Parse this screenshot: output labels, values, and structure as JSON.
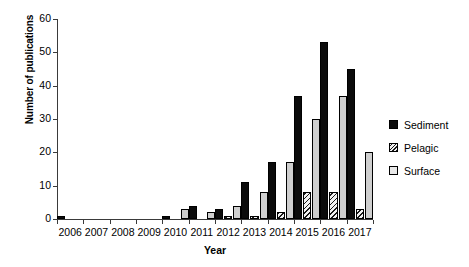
{
  "chart_data": {
    "type": "bar",
    "title": "",
    "xlabel": "Year",
    "ylabel": "Number of publications",
    "categories": [
      "2006",
      "2007",
      "2008",
      "2009",
      "2010",
      "2011",
      "2012",
      "2013",
      "2014",
      "2015",
      "2016",
      "2017"
    ],
    "series": [
      {
        "name": "Sediment",
        "color": "#0b0b0b",
        "pattern": "solid",
        "values": [
          1,
          0,
          0,
          0,
          1,
          4,
          3,
          11,
          17,
          37,
          53,
          45
        ]
      },
      {
        "name": "Pelagic",
        "color": "#f2f2f2",
        "pattern": "diagonal-hatch",
        "values": [
          0,
          0,
          0,
          0,
          0,
          0,
          1,
          1,
          2,
          8,
          8,
          3
        ]
      },
      {
        "name": "Surface",
        "color": "#cfcfcf",
        "pattern": "solid",
        "values": [
          0,
          0,
          0,
          0,
          3,
          2,
          4,
          8,
          17,
          30,
          37,
          20
        ]
      }
    ],
    "ylim": [
      0,
      60
    ],
    "yticks": [
      0,
      10,
      20,
      30,
      40,
      50,
      60
    ],
    "grid": false,
    "legend_position": "right"
  },
  "legend": {
    "items": [
      {
        "label": "Sediment"
      },
      {
        "label": "Pelagic"
      },
      {
        "label": "Surface"
      }
    ]
  }
}
